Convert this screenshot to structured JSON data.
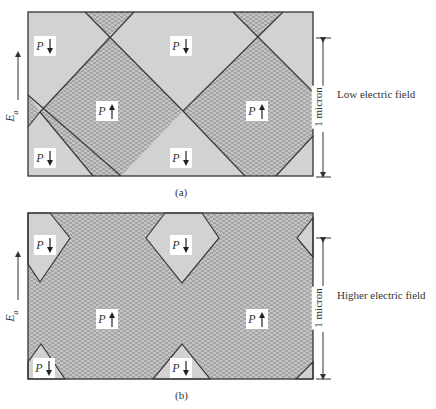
{
  "panels": [
    {
      "id": "a",
      "caption": "(a)",
      "side_label": "Low electric field",
      "dimension_label": "1 micron",
      "field_label_main": "E",
      "field_label_sub": "a",
      "domains": [
        {
          "polarization": "P",
          "direction": "down"
        },
        {
          "polarization": "P",
          "direction": "down"
        },
        {
          "polarization": "P",
          "direction": "up"
        },
        {
          "polarization": "P",
          "direction": "up"
        },
        {
          "polarization": "P",
          "direction": "down"
        },
        {
          "polarization": "P",
          "direction": "down"
        }
      ]
    },
    {
      "id": "b",
      "caption": "(b)",
      "side_label": "Higher electric field",
      "dimension_label": "1 micron",
      "field_label_main": "E",
      "field_label_sub": "a",
      "domains": [
        {
          "polarization": "P",
          "direction": "down"
        },
        {
          "polarization": "P",
          "direction": "down"
        },
        {
          "polarization": "P",
          "direction": "up"
        },
        {
          "polarization": "P",
          "direction": "up"
        },
        {
          "polarization": "P",
          "direction": "down"
        },
        {
          "polarization": "P",
          "direction": "down"
        }
      ]
    }
  ],
  "colors": {
    "down_domain_fill": "#cfcfcf",
    "up_domain_fill": "#bdbdbd",
    "hatch_stroke": "#8a8a8a",
    "wall_stroke": "#3a3a3a",
    "frame_stroke": "#333333"
  }
}
